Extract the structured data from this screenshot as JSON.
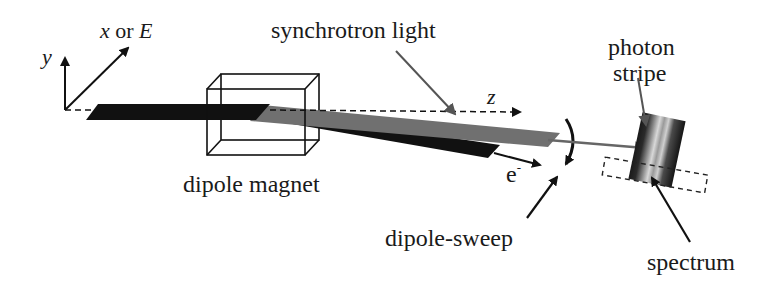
{
  "figure": {
    "colors": {
      "background": "#ffffff",
      "electron_beam": "#111111",
      "synchrotron_light": "#6e6e6e",
      "lines": "#111111",
      "gray_arrow": "#555555"
    }
  },
  "axes": {
    "y_label": "y",
    "x_label_var": "x",
    "x_label_or": " or ",
    "x_label_energy": "E",
    "z_label": "z"
  },
  "labels": {
    "synchrotron_light": "synchrotron light",
    "dipole_magnet": "dipole magnet",
    "electron": "e",
    "electron_superscript": "-",
    "dipole_sweep": "dipole-sweep",
    "photon_stripe_line1": "photon",
    "photon_stripe_line2": "stripe",
    "spectrum": "spectrum"
  }
}
